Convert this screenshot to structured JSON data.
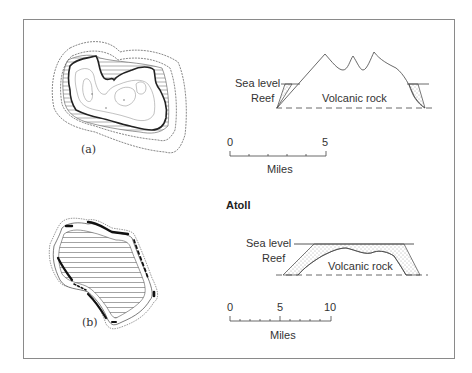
{
  "figure": {
    "section_title": "Atoll",
    "panel_a": {
      "label": "(a)",
      "cross_section": {
        "sea_level_label": "Sea level",
        "reef_label": "Reef",
        "rock_label": "Volcanic rock"
      },
      "scale_bar": {
        "start_label": "0",
        "end_label": "5",
        "unit_label": "Miles",
        "ticks": 5
      }
    },
    "panel_b": {
      "label": "(b)",
      "cross_section": {
        "sea_level_label": "Sea level",
        "reef_label": "Reef",
        "rock_label": "Volcanic rock"
      },
      "scale_bar": {
        "start_label": "0",
        "mid_label": "5",
        "end_label": "10",
        "unit_label": "Miles",
        "ticks": 10
      }
    },
    "colors": {
      "line": "#444444",
      "contour": "#888888",
      "frame": "#8a8a8a",
      "reef_fill": "#222222"
    }
  }
}
